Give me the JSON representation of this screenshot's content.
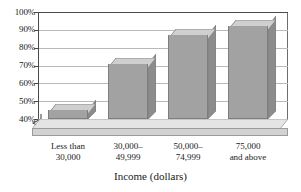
{
  "chart_data": {
    "type": "bar",
    "title": "",
    "xlabel": "Income (dollars)",
    "ylabel": "",
    "categories": [
      "Less than\n30,000",
      "30,000–\n49,999",
      "50,000–\n74,999",
      "75,000\nand above"
    ],
    "category_lines": [
      [
        "Less than",
        "30,000"
      ],
      [
        "30,000–",
        "49,999"
      ],
      [
        "50,000–",
        "74,999"
      ],
      [
        "75,000",
        "and above"
      ]
    ],
    "values": [
      45,
      71,
      87,
      92
    ],
    "ylim": [
      40,
      100
    ],
    "y_ticks": [
      40,
      50,
      60,
      70,
      80,
      90,
      100
    ],
    "y_tick_labels": [
      "40%",
      "50%",
      "60%",
      "70%",
      "80%",
      "90%",
      "100%"
    ],
    "grid": true,
    "legend": "none",
    "axis_break": true,
    "style": "3d-bars",
    "colors": {
      "bar_front": "#a2a2a2",
      "bar_top": "#cfcfcf",
      "bar_side": "#8c8c8c",
      "bar_edge": "#7d7d7d",
      "floor": "#d2d2d2",
      "floor_top": "#e4e4e4",
      "gridline": "#b9b9b9",
      "axis": "#4a4a4a",
      "background": "#ffffff",
      "text": "#1a1a1a"
    }
  },
  "axis_title": {
    "x": "Income (dollars)"
  }
}
